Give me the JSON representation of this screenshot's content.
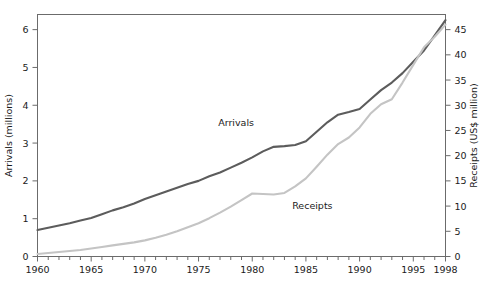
{
  "chart_data": {
    "type": "line",
    "title": "",
    "xlabel": "",
    "grid": false,
    "legend_position": "inline-annotations",
    "x": [
      1960,
      1961,
      1962,
      1963,
      1964,
      1965,
      1966,
      1967,
      1968,
      1969,
      1970,
      1971,
      1972,
      1973,
      1974,
      1975,
      1976,
      1977,
      1978,
      1979,
      1980,
      1981,
      1982,
      1983,
      1984,
      1985,
      1986,
      1987,
      1988,
      1989,
      1990,
      1991,
      1992,
      1993,
      1994,
      1995,
      1996,
      1997,
      1998
    ],
    "xlim": [
      1960,
      1998
    ],
    "xticks_major": [
      1960,
      1965,
      1970,
      1975,
      1980,
      1985,
      1990,
      1995,
      1998
    ],
    "xtick_labels": [
      "1960",
      "1965",
      "1970",
      "1975",
      "1980",
      "1985",
      "1990",
      "1995",
      "1998"
    ],
    "axes": [
      {
        "id": "left",
        "label": "Arrivals (millions)",
        "ylim": [
          0,
          6.4
        ],
        "ticks": [
          0,
          1,
          2,
          3,
          4,
          5,
          6
        ],
        "tick_labels": [
          "0",
          "1",
          "2",
          "3",
          "4",
          "5",
          "6"
        ]
      },
      {
        "id": "right",
        "label": "Receipts (US$ million)",
        "ylim": [
          0,
          48
        ],
        "ticks": [
          0,
          5,
          10,
          15,
          20,
          25,
          30,
          35,
          40,
          45
        ],
        "tick_labels": [
          "0",
          "5",
          "10",
          "15",
          "20",
          "25",
          "30",
          "35",
          "40",
          "45"
        ]
      }
    ],
    "series": [
      {
        "name": "Arrivals",
        "axis": "left",
        "color": "#5c5c5c",
        "label_text": "Arrivals",
        "label_x": 1978.5,
        "label_y": 3.45,
        "values": [
          0.7,
          0.76,
          0.82,
          0.88,
          0.95,
          1.02,
          1.12,
          1.22,
          1.3,
          1.4,
          1.52,
          1.62,
          1.72,
          1.82,
          1.92,
          2.0,
          2.12,
          2.22,
          2.35,
          2.48,
          2.62,
          2.78,
          2.9,
          2.92,
          2.95,
          3.05,
          3.3,
          3.55,
          3.75,
          3.82,
          3.9,
          4.15,
          4.4,
          4.6,
          4.85,
          5.15,
          5.45,
          5.85,
          6.25
        ]
      },
      {
        "name": "Receipts",
        "axis": "right",
        "color": "#c4c4c4",
        "label_text": "Receipts",
        "label_x": 1985.6,
        "label_y": 9.5,
        "values": [
          0.5,
          0.7,
          0.9,
          1.1,
          1.3,
          1.6,
          1.9,
          2.2,
          2.5,
          2.8,
          3.2,
          3.7,
          4.3,
          5.0,
          5.8,
          6.6,
          7.6,
          8.7,
          9.9,
          11.2,
          12.5,
          12.4,
          12.3,
          12.6,
          13.9,
          15.5,
          17.8,
          20.2,
          22.3,
          23.6,
          25.6,
          28.3,
          30.2,
          31.2,
          34.5,
          38.0,
          41.5,
          43.6,
          46.0
        ]
      }
    ]
  }
}
